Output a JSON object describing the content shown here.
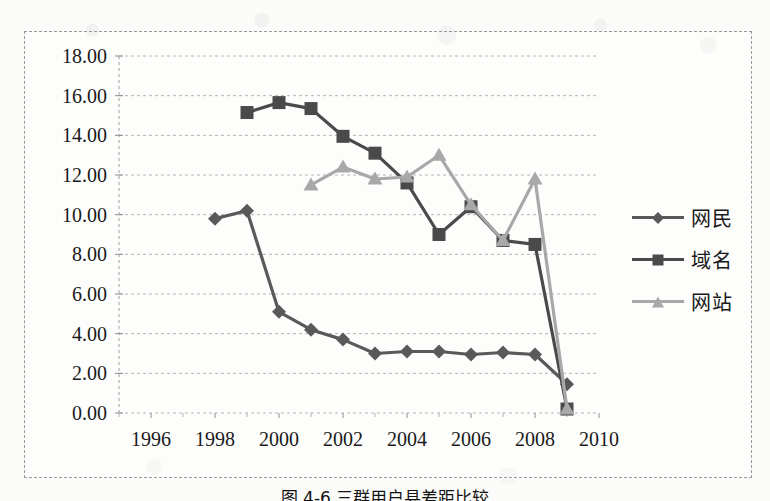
{
  "chart_data": {
    "type": "line",
    "title": "",
    "subtitle": "",
    "xlabel": "",
    "ylabel": "",
    "xlim": [
      1995,
      2010
    ],
    "ylim": [
      0,
      18
    ],
    "ytick_step": 2,
    "xtick_step": 2,
    "grid": true,
    "grid_style": "dashed-horizontal",
    "legend_position": "right",
    "ytick_labels": [
      "0.00",
      "2.00",
      "4.00",
      "6.00",
      "8.00",
      "10.00",
      "12.00",
      "14.00",
      "16.00",
      "18.00"
    ],
    "ytick_values": [
      0,
      2,
      4,
      6,
      8,
      10,
      12,
      14,
      16,
      18
    ],
    "xtick_labels": [
      "1996",
      "1998",
      "2000",
      "2002",
      "2004",
      "2006",
      "2008",
      "2010"
    ],
    "xtick_values": [
      1996,
      1998,
      2000,
      2002,
      2004,
      2006,
      2008,
      2010
    ],
    "series": [
      {
        "name": "网民",
        "marker": "diamond",
        "color": "#595959",
        "x": [
          1998,
          1999,
          2000,
          2001,
          2002,
          2003,
          2004,
          2005,
          2006,
          2007,
          2008,
          2009
        ],
        "values": [
          9.8,
          10.2,
          5.1,
          4.2,
          3.7,
          3.0,
          3.1,
          3.1,
          2.95,
          3.05,
          2.95,
          1.45
        ]
      },
      {
        "name": "域名",
        "marker": "square",
        "color": "#4a4a4a",
        "x": [
          1999,
          2000,
          2001,
          2002,
          2003,
          2004,
          2005,
          2006,
          2007,
          2008,
          2009
        ],
        "values": [
          15.15,
          15.65,
          15.35,
          13.95,
          13.1,
          11.6,
          9.0,
          10.4,
          8.7,
          8.5,
          0.2
        ]
      },
      {
        "name": "网站",
        "marker": "triangle",
        "color": "#a8a8a8",
        "x": [
          2001,
          2002,
          2003,
          2004,
          2005,
          2006,
          2007,
          2008,
          2009
        ],
        "values": [
          11.5,
          12.4,
          11.8,
          11.9,
          13.0,
          10.5,
          8.7,
          11.8,
          0.2
        ]
      }
    ]
  },
  "legend": {
    "items": [
      {
        "label": "网民",
        "marker": "diamond-marker",
        "color": "#595959"
      },
      {
        "label": "域名",
        "marker": "square-marker",
        "color": "#4a4a4a"
      },
      {
        "label": "网站",
        "marker": "triangle-marker",
        "color": "#a8a8a8"
      }
    ]
  },
  "caption": {
    "text": "图 4-6  三群用户县差距比较"
  }
}
